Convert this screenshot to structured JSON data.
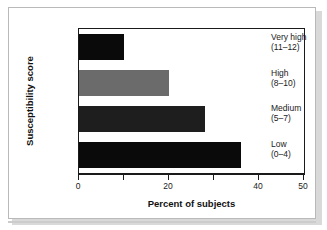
{
  "chart_data": {
    "type": "bar",
    "orientation": "horizontal",
    "title": "",
    "xlabel": "Percent of subjects",
    "ylabel": "Susceptibility score",
    "categories": [
      "Very high (11–12)",
      "High (8–10)",
      "Medium (5–7)",
      "Low (0–4)"
    ],
    "category_lines": [
      {
        "name": "Very high",
        "range": "(11–12)"
      },
      {
        "name": "High",
        "range": "(8–10)"
      },
      {
        "name": "Medium",
        "range": "(5–7)"
      },
      {
        "name": "Low",
        "range": "(0–4)"
      }
    ],
    "values": [
      10,
      20,
      28,
      36
    ],
    "bar_colors": [
      "#0a0a0a",
      "#6b6b6b",
      "#1e1e1e",
      "#0a0a0a"
    ],
    "xlim": [
      0,
      50
    ],
    "xticks": [
      0,
      10,
      20,
      30,
      40,
      50
    ],
    "xtick_labels": [
      "0",
      "",
      "20",
      "",
      "40",
      "50"
    ],
    "grid": false,
    "legend": false
  },
  "axes": {
    "frame_color": "#1a1a1a",
    "background": "#ffffff"
  }
}
